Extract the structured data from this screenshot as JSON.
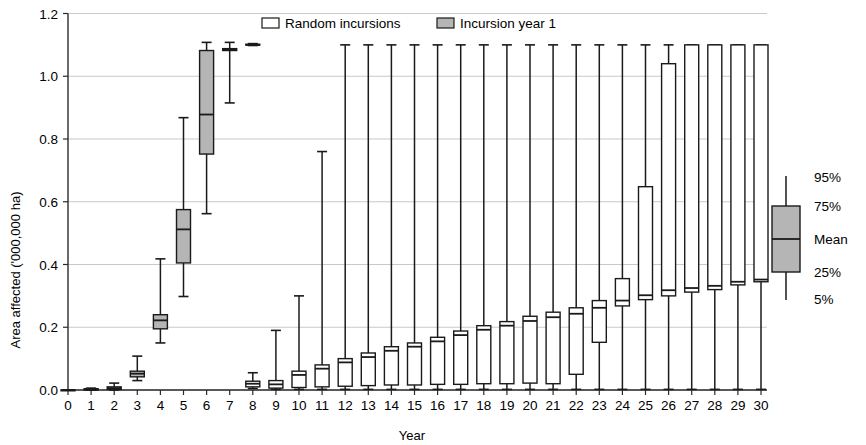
{
  "chart_data": {
    "type": "box",
    "title": "",
    "xlabel": "Year",
    "ylabel": "Area affected ('000,000 ha)",
    "xlim": [
      0,
      30
    ],
    "ylim": [
      0.0,
      1.2
    ],
    "ytick_labels": [
      "0.0",
      "0.2",
      "0.4",
      "0.6",
      "0.8",
      "1.0",
      "1.2"
    ],
    "ytick_values": [
      0.0,
      0.2,
      0.4,
      0.6,
      0.8,
      1.0,
      1.2
    ],
    "xtick_labels": [
      "0",
      "1",
      "2",
      "3",
      "4",
      "5",
      "6",
      "7",
      "8",
      "9",
      "10",
      "11",
      "12",
      "13",
      "14",
      "15",
      "16",
      "17",
      "18",
      "19",
      "20",
      "21",
      "22",
      "23",
      "24",
      "25",
      "26",
      "27",
      "28",
      "29",
      "30"
    ],
    "grid": true,
    "legend_position": "top-center",
    "series": [
      {
        "name": "Random incursions",
        "fill": "#ffffff",
        "boxes": [
          {
            "x": 8,
            "low": 0.005,
            "q25": 0.01,
            "mean": 0.02,
            "q75": 0.028,
            "high": 0.055
          },
          {
            "x": 9,
            "low": 0.002,
            "q25": 0.006,
            "mean": 0.018,
            "q75": 0.03,
            "high": 0.19
          },
          {
            "x": 10,
            "low": 0.002,
            "q25": 0.008,
            "mean": 0.048,
            "q75": 0.06,
            "high": 0.3
          },
          {
            "x": 11,
            "low": 0.002,
            "q25": 0.01,
            "mean": 0.068,
            "q75": 0.08,
            "high": 0.76
          },
          {
            "x": 12,
            "low": 0.002,
            "q25": 0.012,
            "mean": 0.088,
            "q75": 0.1,
            "high": 1.1
          },
          {
            "x": 13,
            "low": 0.002,
            "q25": 0.014,
            "mean": 0.105,
            "q75": 0.118,
            "high": 1.1
          },
          {
            "x": 14,
            "low": 0.002,
            "q25": 0.016,
            "mean": 0.125,
            "q75": 0.138,
            "high": 1.1
          },
          {
            "x": 15,
            "low": 0.002,
            "q25": 0.016,
            "mean": 0.138,
            "q75": 0.15,
            "high": 1.1
          },
          {
            "x": 16,
            "low": 0.002,
            "q25": 0.018,
            "mean": 0.155,
            "q75": 0.168,
            "high": 1.1
          },
          {
            "x": 17,
            "low": 0.002,
            "q25": 0.018,
            "mean": 0.175,
            "q75": 0.188,
            "high": 1.1
          },
          {
            "x": 18,
            "low": 0.002,
            "q25": 0.02,
            "mean": 0.192,
            "q75": 0.205,
            "high": 1.1
          },
          {
            "x": 19,
            "low": 0.002,
            "q25": 0.02,
            "mean": 0.205,
            "q75": 0.218,
            "high": 1.1
          },
          {
            "x": 20,
            "low": 0.002,
            "q25": 0.022,
            "mean": 0.22,
            "q75": 0.235,
            "high": 1.1
          },
          {
            "x": 21,
            "low": 0.002,
            "q25": 0.02,
            "mean": 0.232,
            "q75": 0.248,
            "high": 1.1
          },
          {
            "x": 22,
            "low": 0.002,
            "q25": 0.05,
            "mean": 0.243,
            "q75": 0.262,
            "high": 1.1
          },
          {
            "x": 23,
            "low": 0.002,
            "q25": 0.152,
            "mean": 0.262,
            "q75": 0.285,
            "high": 1.1
          },
          {
            "x": 24,
            "low": 0.002,
            "q25": 0.268,
            "mean": 0.285,
            "q75": 0.355,
            "high": 1.1
          },
          {
            "x": 25,
            "low": 0.002,
            "q25": 0.288,
            "mean": 0.302,
            "q75": 0.648,
            "high": 1.1
          },
          {
            "x": 26,
            "low": 0.002,
            "q25": 0.3,
            "mean": 0.318,
            "q75": 1.04,
            "high": 1.1
          },
          {
            "x": 27,
            "low": 0.002,
            "q25": 0.312,
            "mean": 0.325,
            "q75": 1.1,
            "high": 1.1
          },
          {
            "x": 28,
            "low": 0.002,
            "q25": 0.32,
            "mean": 0.332,
            "q75": 1.1,
            "high": 1.1
          },
          {
            "x": 29,
            "low": 0.002,
            "q25": 0.335,
            "mean": 0.345,
            "q75": 1.1,
            "high": 1.1
          },
          {
            "x": 30,
            "low": 0.002,
            "q25": 0.345,
            "mean": 0.352,
            "q75": 1.1,
            "high": 1.1
          }
        ]
      },
      {
        "name": "Incursion year 1",
        "fill": "#b5b5b5",
        "boxes": [
          {
            "x": 0,
            "low": 0.0,
            "q25": 0.0,
            "mean": 0.0,
            "q75": 0.0,
            "high": 0.0
          },
          {
            "x": 1,
            "low": 0.0,
            "q25": 0.0,
            "mean": 0.002,
            "q75": 0.004,
            "high": 0.006
          },
          {
            "x": 2,
            "low": 0.0,
            "q25": 0.002,
            "mean": 0.006,
            "q75": 0.01,
            "high": 0.022
          },
          {
            "x": 3,
            "low": 0.03,
            "q25": 0.042,
            "mean": 0.052,
            "q75": 0.06,
            "high": 0.108
          },
          {
            "x": 4,
            "low": 0.15,
            "q25": 0.195,
            "mean": 0.222,
            "q75": 0.24,
            "high": 0.418
          },
          {
            "x": 5,
            "low": 0.298,
            "q25": 0.405,
            "mean": 0.512,
            "q75": 0.575,
            "high": 0.868
          },
          {
            "x": 6,
            "low": 0.562,
            "q25": 0.752,
            "mean": 0.878,
            "q75": 1.082,
            "high": 1.108
          },
          {
            "x": 7,
            "low": 0.915,
            "q25": 1.082,
            "mean": 1.085,
            "q75": 1.088,
            "high": 1.108
          },
          {
            "x": 8,
            "low": 1.098,
            "q25": 1.1,
            "mean": 1.1,
            "q75": 1.102,
            "high": 1.104
          }
        ]
      }
    ]
  },
  "legend": {
    "items": [
      {
        "label": "Random incursions",
        "swatch": "#ffffff"
      },
      {
        "label": "Incursion year 1",
        "swatch": "#b5b5b5"
      }
    ]
  },
  "key": {
    "labels": [
      "95%",
      "75%",
      "Mean",
      "25%",
      "5%"
    ],
    "swatch_fill": "#b5b5b5"
  },
  "colors": {
    "grid": "#c9c9c9",
    "axis": "#2b2b2b",
    "ink": "#1a1a1a",
    "gray_fill": "#b5b5b5",
    "white_fill": "#ffffff"
  }
}
